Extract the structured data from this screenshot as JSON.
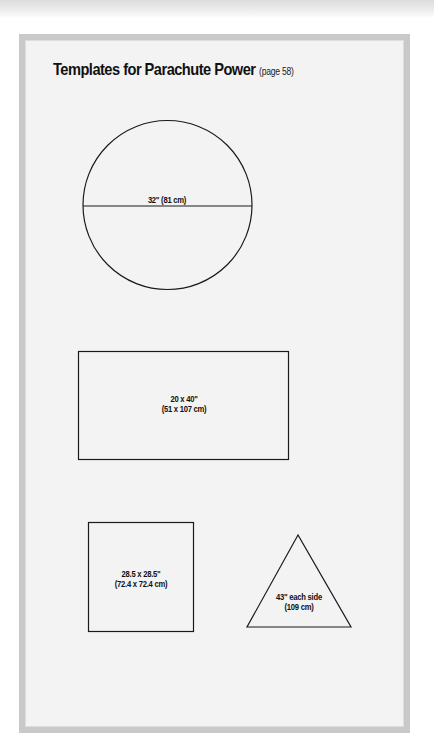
{
  "page": {
    "title": "Templates for Parachute Power",
    "page_ref": "(page 58)"
  },
  "templates": {
    "circle": {
      "label": "32\" (81 cm)"
    },
    "rectangle": {
      "label_line1": "20 x 40\"",
      "label_line2": "(51 x 107 cm)"
    },
    "square": {
      "label_line1": "28.5 x 28.5\"",
      "label_line2": "(72.4 x 72.4 cm)"
    },
    "triangle": {
      "label_line1": "43\" each side",
      "label_line2": "(109 cm)"
    }
  },
  "colors": {
    "frame_border": "#c9c9c9",
    "frame_fill": "#f3f3f3",
    "stroke": "#1a1a1a"
  }
}
